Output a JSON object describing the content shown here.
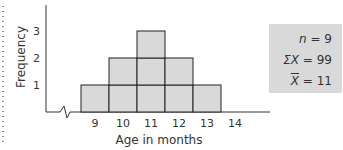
{
  "chart_data": {
    "type": "bar",
    "subtype": "histogram",
    "title": "",
    "xlabel": "Age in months",
    "ylabel": "Frequency",
    "categories": [
      "9",
      "10",
      "11",
      "12",
      "13"
    ],
    "x_ticks": [
      "9",
      "10",
      "11",
      "12",
      "13",
      "14"
    ],
    "y_ticks": [
      "1",
      "2",
      "3"
    ],
    "values": [
      1,
      2,
      3,
      2,
      1
    ],
    "ylim": [
      0,
      3
    ],
    "grid": false,
    "axis_break": true,
    "bar_color": "#d9d9d9",
    "annotations": {
      "n": "n = 9",
      "sum": "ΣX = 99",
      "mean": "X̄ = 11"
    }
  },
  "stats": {
    "n_label": "n",
    "n_value": "= 9",
    "sum_label": "ΣX",
    "sum_value": "= 99",
    "mean_label": "X",
    "mean_value": "= 11"
  }
}
